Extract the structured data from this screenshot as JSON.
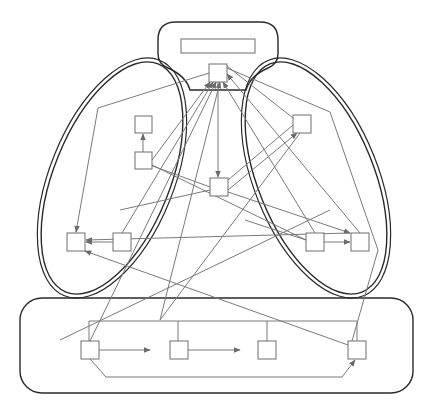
{
  "diagram": {
    "title": "",
    "colors": {
      "container_stroke": "#2a2a2a",
      "node_stroke": "#6e6e6e",
      "edge_stroke": "#7a7a7a",
      "background": "#ffffff"
    },
    "containers": [
      {
        "id": "top-group",
        "shape": "rounded-rect-with-neck",
        "label": ""
      },
      {
        "id": "left-group",
        "shape": "ellipse-double",
        "label": ""
      },
      {
        "id": "right-group",
        "shape": "ellipse-double",
        "label": ""
      },
      {
        "id": "bottom-group",
        "shape": "rounded-rect",
        "label": ""
      }
    ],
    "nodes": [
      {
        "id": "header-bar",
        "x": 181,
        "y": 39,
        "w": 74,
        "h": 14,
        "group": "top-group",
        "label": ""
      },
      {
        "id": "top-hub",
        "x": 209,
        "y": 64,
        "w": 18,
        "h": 18,
        "group": "top-group",
        "label": ""
      },
      {
        "id": "left-a",
        "x": 135,
        "y": 116,
        "w": 17,
        "h": 17,
        "group": "left-group",
        "label": ""
      },
      {
        "id": "left-b",
        "x": 135,
        "y": 152,
        "w": 17,
        "h": 17,
        "group": "left-group",
        "label": ""
      },
      {
        "id": "left-c",
        "x": 67,
        "y": 233,
        "w": 18,
        "h": 18,
        "group": "left-group",
        "label": ""
      },
      {
        "id": "left-d",
        "x": 113,
        "y": 233,
        "w": 18,
        "h": 18,
        "group": "left-group",
        "label": ""
      },
      {
        "id": "center",
        "x": 210,
        "y": 178,
        "w": 18,
        "h": 18,
        "group": "none",
        "label": ""
      },
      {
        "id": "right-a",
        "x": 293,
        "y": 115,
        "w": 18,
        "h": 18,
        "group": "right-group",
        "label": ""
      },
      {
        "id": "right-b",
        "x": 306,
        "y": 233,
        "w": 18,
        "h": 18,
        "group": "right-group",
        "label": ""
      },
      {
        "id": "right-c",
        "x": 351,
        "y": 233,
        "w": 18,
        "h": 18,
        "group": "right-group",
        "label": ""
      },
      {
        "id": "bottom-a",
        "x": 81,
        "y": 341,
        "w": 18,
        "h": 18,
        "group": "bottom-group",
        "label": ""
      },
      {
        "id": "bottom-b",
        "x": 170,
        "y": 341,
        "w": 18,
        "h": 18,
        "group": "bottom-group",
        "label": ""
      },
      {
        "id": "bottom-c",
        "x": 258,
        "y": 341,
        "w": 18,
        "h": 18,
        "group": "bottom-group",
        "label": ""
      },
      {
        "id": "bottom-d",
        "x": 348,
        "y": 341,
        "w": 18,
        "h": 18,
        "group": "bottom-group",
        "label": ""
      }
    ],
    "edges": [
      {
        "from": "left-b",
        "to": "left-a",
        "arrow": true
      },
      {
        "from": "left-d",
        "to": "left-c",
        "arrow": true
      },
      {
        "from": "right-b",
        "to": "right-c",
        "arrow": true
      },
      {
        "from": "top-hub",
        "to": "center",
        "arrow": true
      },
      {
        "from": "bottom-a",
        "to": "bottom-b",
        "arrow": true
      },
      {
        "from": "bottom-b",
        "to": "bottom-c",
        "arrow": true
      },
      {
        "from": "bottom-a",
        "to": "bottom-d",
        "arrow": true,
        "routing": "bus-below"
      },
      {
        "from": "bottom-group-bus",
        "to": "top-hub",
        "arrow": true
      }
    ]
  }
}
